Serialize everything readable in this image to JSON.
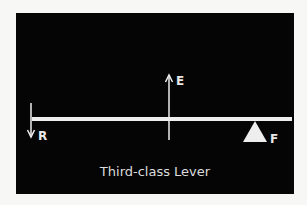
{
  "diagram": {
    "caption": "Third-class Lever",
    "labels": {
      "resistance": "R",
      "effort": "E",
      "fulcrum": "F"
    },
    "colors": {
      "background": "#050505",
      "foreground": "#eeeeee",
      "page": "#f7f7f5"
    }
  }
}
